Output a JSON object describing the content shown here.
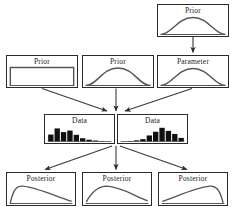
{
  "diagram": {
    "canvas": {
      "width": 234,
      "height": 211
    },
    "style": {
      "background": "#ffffff",
      "box_border": "#2a2a2a",
      "curve_stroke": "#555555",
      "bar_fill": "#111111",
      "arrow_stroke": "#3a3a3a",
      "text_color": "#1a1a1a"
    },
    "nodes": [
      {
        "id": "hyperprior",
        "label": "Prior",
        "kind": "distribution",
        "shape": "normal",
        "x": 157,
        "y": 4,
        "w": 72,
        "h": 33
      },
      {
        "id": "prior-uniform",
        "label": "Prior",
        "kind": "distribution",
        "shape": "uniform",
        "x": 6,
        "y": 55,
        "w": 72,
        "h": 33
      },
      {
        "id": "prior-normal",
        "label": "Prior",
        "kind": "distribution",
        "shape": "normal",
        "x": 82,
        "y": 55,
        "w": 72,
        "h": 33
      },
      {
        "id": "parameter",
        "label": "Parameter",
        "kind": "distribution",
        "shape": "normal",
        "x": 157,
        "y": 55,
        "w": 72,
        "h": 33
      },
      {
        "id": "data-left",
        "label": "Data",
        "kind": "histogram",
        "shape": "right-skewed",
        "x": 44,
        "y": 114,
        "w": 71,
        "h": 30
      },
      {
        "id": "data-right",
        "label": "Data",
        "kind": "histogram",
        "shape": "left-skewed",
        "x": 117,
        "y": 114,
        "w": 71,
        "h": 30
      },
      {
        "id": "posterior-left",
        "label": "Posterior",
        "kind": "distribution",
        "shape": "right-skewed",
        "x": 6,
        "y": 172,
        "w": 70,
        "h": 34
      },
      {
        "id": "posterior-middle",
        "label": "Posterior",
        "kind": "distribution",
        "shape": "right-skewed",
        "x": 82,
        "y": 172,
        "w": 70,
        "h": 34
      },
      {
        "id": "posterior-right",
        "label": "Posterior",
        "kind": "distribution",
        "shape": "left-skewed",
        "x": 158,
        "y": 172,
        "w": 70,
        "h": 34
      }
    ],
    "edges": [
      {
        "id": "hyperprior-to-parameter",
        "from": "hyperprior",
        "to": "parameter",
        "points": "193,37 193,53"
      },
      {
        "id": "prior-uniform-to-data",
        "from": "prior-uniform",
        "to": "data-left",
        "points": "42,88 108,111"
      },
      {
        "id": "prior-normal-to-data",
        "from": "prior-normal",
        "to": "data",
        "points": "116,88 116,111"
      },
      {
        "id": "parameter-to-data",
        "from": "parameter",
        "to": "data-right",
        "points": "193,88 124,111"
      },
      {
        "id": "data-to-posterior-left",
        "from": "data",
        "to": "posterior-left",
        "points": "112,146 45,170"
      },
      {
        "id": "data-to-posterior-middle",
        "from": "data",
        "to": "posterior-middle",
        "points": "116,146 116,170"
      },
      {
        "id": "data-to-posterior-right",
        "from": "data",
        "to": "posterior-right",
        "points": "120,146 188,170"
      }
    ],
    "histogram_data": {
      "data-left": [
        0.46,
        0.86,
        0.62,
        0.72,
        0.44,
        0.22,
        0.12,
        0.07,
        0.04,
        0.02
      ],
      "data-right": [
        0.02,
        0.04,
        0.08,
        0.16,
        0.4,
        0.64,
        0.9,
        0.7,
        0.5,
        0.24
      ]
    }
  }
}
